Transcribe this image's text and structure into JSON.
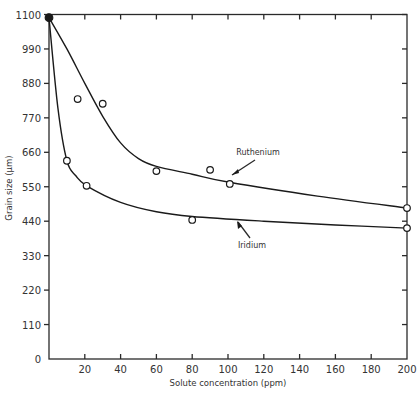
{
  "chart_data": {
    "type": "line",
    "title": "",
    "xlabel": "Solute concentration (ppm)",
    "ylabel": "Grain size (μm)",
    "xlim": [
      0,
      200
    ],
    "ylim": [
      0,
      1100
    ],
    "xticks": [
      20,
      40,
      60,
      80,
      100,
      120,
      140,
      160,
      180,
      200
    ],
    "yticks": [
      0,
      110,
      220,
      330,
      440,
      550,
      660,
      770,
      880,
      990,
      1100
    ],
    "grid": false,
    "start_point": {
      "x": 0,
      "y": 1090,
      "filled": true
    },
    "series": [
      {
        "name": "Ruthenium",
        "points": [
          {
            "x": 16,
            "y": 830
          },
          {
            "x": 30,
            "y": 815
          },
          {
            "x": 60,
            "y": 600
          },
          {
            "x": 90,
            "y": 604
          },
          {
            "x": 101,
            "y": 559
          },
          {
            "x": 200,
            "y": 482
          }
        ],
        "curve": [
          {
            "x": 0,
            "y": 1090
          },
          {
            "x": 10,
            "y": 990
          },
          {
            "x": 20,
            "y": 880
          },
          {
            "x": 30,
            "y": 775
          },
          {
            "x": 40,
            "y": 690
          },
          {
            "x": 50,
            "y": 640
          },
          {
            "x": 60,
            "y": 615
          },
          {
            "x": 80,
            "y": 590
          },
          {
            "x": 100,
            "y": 565
          },
          {
            "x": 150,
            "y": 520
          },
          {
            "x": 200,
            "y": 482
          }
        ]
      },
      {
        "name": "Iridium",
        "points": [
          {
            "x": 10,
            "y": 633
          },
          {
            "x": 21,
            "y": 553
          },
          {
            "x": 80,
            "y": 444
          },
          {
            "x": 200,
            "y": 418
          }
        ],
        "curve": [
          {
            "x": 0,
            "y": 1090
          },
          {
            "x": 5,
            "y": 800
          },
          {
            "x": 10,
            "y": 633
          },
          {
            "x": 15,
            "y": 585
          },
          {
            "x": 21,
            "y": 553
          },
          {
            "x": 40,
            "y": 500
          },
          {
            "x": 60,
            "y": 470
          },
          {
            "x": 80,
            "y": 455
          },
          {
            "x": 120,
            "y": 440
          },
          {
            "x": 160,
            "y": 428
          },
          {
            "x": 200,
            "y": 418
          }
        ]
      }
    ],
    "annotations": [
      {
        "text": "Ruthenium",
        "points_to_series": "Ruthenium",
        "near_x": 103
      },
      {
        "text": "Iridium",
        "points_to_series": "Iridium",
        "near_x": 86
      }
    ]
  }
}
